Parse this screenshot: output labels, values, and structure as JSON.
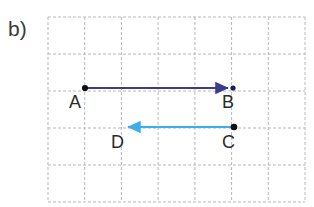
{
  "figure": {
    "part_label": "b)",
    "background_color": "#ffffff",
    "grid": {
      "x0": 48,
      "y0": 17,
      "x1": 305,
      "y1": 202,
      "columns": 7,
      "rows": 5,
      "line_color": "#b9b9b9",
      "line_style": "dashed",
      "cell_width": 36.7,
      "cell_height": 37.0
    },
    "vectors": [
      {
        "name": "AB",
        "color": "#3b3b8f",
        "from_label": "A",
        "to_label": "B",
        "x_start": 85,
        "y_start": 88,
        "x_end": 234,
        "y_end": 88,
        "direction": "right",
        "length_cells": 4
      },
      {
        "name": "CD",
        "color": "#3caeeb",
        "from_label": "C",
        "to_label": "D",
        "x_start": 234,
        "y_start": 127,
        "x_end": 122,
        "y_end": 127,
        "direction": "left",
        "length_cells": 3
      }
    ],
    "points": [
      {
        "label": "A",
        "x": 85,
        "y": 88,
        "dot_color": "#111111"
      },
      {
        "label": "B",
        "x": 234,
        "y": 88,
        "dot_color": "#111111"
      },
      {
        "label": "C",
        "x": 234,
        "y": 127,
        "dot_color": "#111111"
      },
      {
        "label": "D",
        "x": 122,
        "y": 127,
        "dot_color": "#111111"
      }
    ],
    "point_labels": {
      "a": "A",
      "b": "B",
      "c": "C",
      "d": "D"
    }
  }
}
